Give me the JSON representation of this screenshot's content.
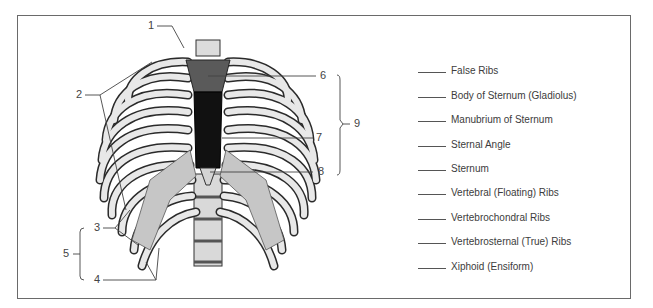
{
  "diagram": {
    "colors": {
      "frame": "#6a6a6a",
      "bone_fill": "#e6e6e6",
      "bone_shade": "#c8c8c8",
      "outline": "#2a2a2a",
      "manubrium": "#5a5a5a",
      "sternum_body": "#111111"
    },
    "callouts": [
      {
        "id": "1",
        "label": "1"
      },
      {
        "id": "2",
        "label": "2"
      },
      {
        "id": "3",
        "label": "3"
      },
      {
        "id": "4",
        "label": "4"
      },
      {
        "id": "5",
        "label": "5"
      },
      {
        "id": "6",
        "label": "6"
      },
      {
        "id": "7",
        "label": "7"
      },
      {
        "id": "8",
        "label": "8"
      },
      {
        "id": "9",
        "label": "9"
      }
    ],
    "answer_list": [
      {
        "text": "False Ribs"
      },
      {
        "text": "Body of Sternum (Gladiolus)"
      },
      {
        "text": "Manubrium of Sternum"
      },
      {
        "text": "Sternal Angle"
      },
      {
        "text": "Sternum"
      },
      {
        "text": "Vertebral (Floating) Ribs"
      },
      {
        "text": "Vertebrochondral Ribs"
      },
      {
        "text": "Vertebrosternal (True) Ribs"
      },
      {
        "text": "Xiphoid (Ensiform)"
      }
    ]
  }
}
